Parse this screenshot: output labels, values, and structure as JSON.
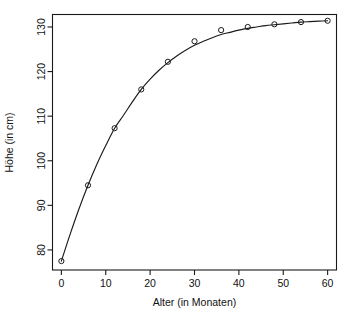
{
  "chart_data": {
    "type": "scatter",
    "title": "",
    "subtitle": "",
    "xlabel": "Alter (in Monaten)",
    "ylabel": "Höhe (in cm)",
    "xlim": [
      -2,
      62
    ],
    "ylim": [
      75.5,
      132.8
    ],
    "xticks": [
      0,
      10,
      20,
      30,
      40,
      50,
      60
    ],
    "xtick_labels": [
      "0",
      "10",
      "20",
      "30",
      "40",
      "50",
      "60"
    ],
    "yticks": [
      80,
      90,
      100,
      110,
      120,
      130
    ],
    "ytick_labels": [
      "80",
      "90",
      "100",
      "110",
      "120",
      "130"
    ],
    "grid": false,
    "legend": false,
    "legend_position": "none",
    "point_marker": "open-circle",
    "point_color": "#1a1a1a",
    "line_color": "#1a1a1a",
    "x": [
      0,
      6,
      12,
      18,
      24,
      30,
      36,
      42,
      48,
      54,
      60
    ],
    "values": [
      77.5,
      94.5,
      107.3,
      116.0,
      122.2,
      126.8,
      129.3,
      130.0,
      130.6,
      131.1,
      131.4
    ],
    "series": [
      {
        "name": "Beobachtete Höhe",
        "kind": "points",
        "x": [
          0,
          6,
          12,
          18,
          24,
          30,
          36,
          42,
          48,
          54,
          60
        ],
        "values": [
          77.5,
          94.5,
          107.3,
          116.0,
          122.2,
          126.8,
          129.3,
          130.0,
          130.6,
          131.1,
          131.4
        ]
      },
      {
        "name": "Angepasste Wachstumskurve",
        "kind": "line",
        "x": [
          0,
          2,
          4,
          6,
          8,
          10,
          12,
          14,
          16,
          18,
          20,
          22,
          24,
          26,
          28,
          30,
          32,
          34,
          36,
          38,
          40,
          42,
          44,
          46,
          48,
          50,
          52,
          54,
          56,
          58,
          60
        ],
        "values": [
          77.5,
          83.6,
          89.3,
          94.5,
          99.2,
          103.4,
          107.3,
          110.2,
          113.2,
          116.0,
          118.3,
          120.3,
          122.0,
          123.5,
          124.8,
          125.9,
          126.8,
          127.6,
          128.3,
          128.8,
          129.3,
          129.7,
          130.0,
          130.3,
          130.5,
          130.7,
          130.9,
          131.1,
          131.2,
          131.3,
          131.4
        ]
      }
    ]
  },
  "axes": {
    "x_title": "Alter (in Monaten)",
    "y_title": "Höhe (in cm)"
  }
}
